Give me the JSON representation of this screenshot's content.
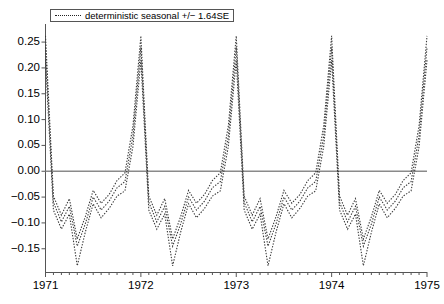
{
  "chart_data": {
    "type": "line",
    "title": "",
    "xlabel": "",
    "ylabel": "",
    "xlim": [
      1971.0,
      1975.0
    ],
    "ylim": [
      -0.195,
      0.285
    ],
    "grid": false,
    "zero_line": 0.0,
    "legend_position": "top-left",
    "legend": [
      "deterministic seasonal +/- 1.64SE"
    ],
    "xticks": [
      "1971",
      "1972",
      "1973",
      "1974",
      "1975"
    ],
    "xtick_values": [
      1971,
      1972,
      1973,
      1974,
      1975
    ],
    "minor_xticks_per_year": 12,
    "yticks": [
      "0.25",
      "0.20",
      "0.15",
      "0.10",
      "0.05",
      "0.00",
      "-0.05",
      "-0.10",
      "-0.15"
    ],
    "ytick_values": [
      0.25,
      0.2,
      0.15,
      0.1,
      0.05,
      0.0,
      -0.05,
      -0.1,
      -0.15
    ],
    "line_style": "dotted",
    "line_color": "#3a3a3a",
    "zero_line_color": "#8a8a8a",
    "axis_color": "#555555",
    "series": [
      {
        "name": "deterministic seasonal +1.64SE",
        "x": [
          1971.0,
          1971.083,
          1971.167,
          1971.25,
          1971.333,
          1971.417,
          1971.5,
          1971.583,
          1971.667,
          1971.75,
          1971.833,
          1971.917,
          1972.0,
          1972.083,
          1972.167,
          1972.25,
          1972.333,
          1972.417,
          1972.5,
          1972.583,
          1972.667,
          1972.75,
          1972.833,
          1972.917,
          1973.0,
          1973.083,
          1973.167,
          1973.25,
          1973.333,
          1973.417,
          1973.5,
          1973.583,
          1973.667,
          1973.75,
          1973.833,
          1973.917,
          1974.0,
          1974.083,
          1974.167,
          1974.25,
          1974.333,
          1974.417,
          1974.5,
          1974.583,
          1974.667,
          1974.75,
          1974.833,
          1974.917,
          1975.0
        ],
        "values": [
          0.262,
          -0.048,
          -0.085,
          -0.053,
          -0.131,
          -0.088,
          -0.037,
          -0.062,
          -0.045,
          -0.018,
          -0.003,
          0.088,
          0.262,
          -0.048,
          -0.085,
          -0.053,
          -0.131,
          -0.088,
          -0.037,
          -0.062,
          -0.045,
          -0.018,
          -0.003,
          0.088,
          0.262,
          -0.048,
          -0.085,
          -0.053,
          -0.131,
          -0.088,
          -0.037,
          -0.062,
          -0.045,
          -0.018,
          -0.003,
          0.088,
          0.262,
          -0.048,
          -0.085,
          -0.053,
          -0.131,
          -0.088,
          -0.037,
          -0.062,
          -0.045,
          -0.018,
          -0.003,
          0.088,
          0.262
        ]
      },
      {
        "name": "deterministic seasonal (point estimate)",
        "x": [
          1971.0,
          1971.083,
          1971.167,
          1971.25,
          1971.333,
          1971.417,
          1971.5,
          1971.583,
          1971.667,
          1971.75,
          1971.833,
          1971.917,
          1972.0,
          1972.083,
          1972.167,
          1972.25,
          1972.333,
          1972.417,
          1972.5,
          1972.583,
          1972.667,
          1972.75,
          1972.833,
          1972.917,
          1973.0,
          1973.083,
          1973.167,
          1973.25,
          1973.333,
          1973.417,
          1973.5,
          1973.583,
          1973.667,
          1973.75,
          1973.833,
          1973.917,
          1974.0,
          1974.083,
          1974.167,
          1974.25,
          1974.333,
          1974.417,
          1974.5,
          1974.583,
          1974.667,
          1974.75,
          1974.833,
          1974.917,
          1975.0
        ],
        "values": [
          0.24,
          -0.06,
          -0.098,
          -0.068,
          -0.145,
          -0.102,
          -0.05,
          -0.075,
          -0.058,
          -0.032,
          -0.02,
          0.068,
          0.24,
          -0.06,
          -0.098,
          -0.068,
          -0.145,
          -0.102,
          -0.05,
          -0.075,
          -0.058,
          -0.032,
          -0.02,
          0.068,
          0.24,
          -0.06,
          -0.098,
          -0.068,
          -0.145,
          -0.102,
          -0.05,
          -0.075,
          -0.058,
          -0.032,
          -0.02,
          0.068,
          0.24,
          -0.06,
          -0.098,
          -0.068,
          -0.145,
          -0.102,
          -0.05,
          -0.075,
          -0.058,
          -0.032,
          -0.02,
          0.068,
          0.24
        ]
      },
      {
        "name": "deterministic seasonal -1.64SE",
        "x": [
          1971.0,
          1971.083,
          1971.167,
          1971.25,
          1971.333,
          1971.417,
          1971.5,
          1971.583,
          1971.667,
          1971.75,
          1971.833,
          1971.917,
          1972.0,
          1972.083,
          1972.167,
          1972.25,
          1972.333,
          1972.417,
          1972.5,
          1972.583,
          1972.667,
          1972.75,
          1972.833,
          1972.917,
          1973.0,
          1973.083,
          1973.167,
          1973.25,
          1973.333,
          1973.417,
          1973.5,
          1973.583,
          1973.667,
          1973.75,
          1973.833,
          1973.917,
          1974.0,
          1974.083,
          1974.167,
          1974.25,
          1974.333,
          1974.417,
          1974.5,
          1974.583,
          1974.667,
          1974.75,
          1974.833,
          1974.917,
          1975.0
        ],
        "values": [
          0.215,
          -0.075,
          -0.112,
          -0.083,
          -0.183,
          -0.118,
          -0.063,
          -0.09,
          -0.072,
          -0.048,
          -0.038,
          0.048,
          0.215,
          -0.075,
          -0.112,
          -0.083,
          -0.183,
          -0.118,
          -0.063,
          -0.09,
          -0.072,
          -0.048,
          -0.038,
          0.048,
          0.215,
          -0.075,
          -0.112,
          -0.083,
          -0.183,
          -0.118,
          -0.063,
          -0.09,
          -0.072,
          -0.048,
          -0.038,
          0.048,
          0.215,
          -0.075,
          -0.112,
          -0.083,
          -0.183,
          -0.118,
          -0.063,
          -0.09,
          -0.072,
          -0.048,
          -0.038,
          0.048,
          0.215
        ]
      }
    ]
  },
  "legend": {
    "label": "deterministic seasonal +/− 1.64SE"
  },
  "axes": {
    "y_labels": [
      "0.25",
      "0.20",
      "0.15",
      "0.10",
      "0.05",
      "0.00",
      "−0.05",
      "−0.10",
      "−0.15"
    ],
    "x_labels": [
      "1971",
      "1972",
      "1973",
      "1974",
      "1975"
    ]
  }
}
